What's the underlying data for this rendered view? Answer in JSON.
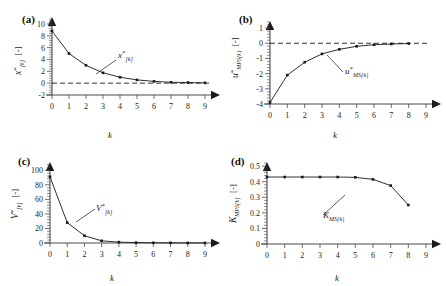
{
  "figure": {
    "panels": [
      "(a)",
      "(b)",
      "(c)",
      "(d)"
    ]
  },
  "chart_data": [
    {
      "type": "line",
      "panel_label": "(a)",
      "title": "",
      "xlabel": "k",
      "ylabel": "x*[k] [-]",
      "ylabel_parts": {
        "base": "x",
        "sup": "*",
        "sub": "[k]",
        "unit": "[-]"
      },
      "annotation": "x*[k]",
      "annotation_parts": {
        "base": "x",
        "sup": "*",
        "sub": "[k]"
      },
      "x": [
        0,
        1,
        2,
        3,
        4,
        5,
        6,
        7,
        8,
        9
      ],
      "values": [
        8.8,
        5.0,
        3.0,
        1.75,
        1.0,
        0.55,
        0.3,
        0.15,
        0.1,
        0.05
      ],
      "xlim": [
        0,
        9
      ],
      "ylim": [
        -2,
        11
      ],
      "yticks": [
        -2,
        0,
        2,
        4,
        6,
        8,
        10
      ],
      "ytick_labels": [
        "-2",
        "0",
        "2",
        "4",
        "6",
        "8",
        "10"
      ],
      "xticks": [
        0,
        1,
        2,
        3,
        4,
        5,
        6,
        7,
        8,
        9
      ],
      "xtick_labels": [
        "0",
        "1",
        "2",
        "3",
        "4",
        "5",
        "6",
        "7",
        "8",
        "9"
      ],
      "reference_line": 0,
      "grid": false,
      "legend": "none"
    },
    {
      "type": "line",
      "panel_label": "(b)",
      "title": "",
      "xlabel": "k",
      "ylabel": "u*MPS{k} [-]",
      "ylabel_parts": {
        "base": "u",
        "sup": "*",
        "sub": "MPS{k}",
        "unit": "[-]"
      },
      "annotation": "u*MS{k}",
      "annotation_parts": {
        "base": "u",
        "sup": "*",
        "sub": "MS{k}"
      },
      "x": [
        0,
        1,
        2,
        3,
        4,
        5,
        6,
        7,
        8
      ],
      "values": [
        -3.9,
        -2.1,
        -1.25,
        -0.7,
        -0.4,
        -0.2,
        -0.1,
        -0.05,
        -0.02
      ],
      "xlim": [
        0,
        9
      ],
      "ylim": [
        -4,
        1.4
      ],
      "yticks": [
        -4,
        -3,
        -2,
        -1,
        0,
        1
      ],
      "ytick_labels": [
        "-4",
        "-3",
        "-2",
        "-1",
        "0",
        "1"
      ],
      "xticks": [
        0,
        1,
        2,
        3,
        4,
        5,
        6,
        7,
        8,
        9
      ],
      "xtick_labels": [
        "0",
        "1",
        "2",
        "3",
        "4",
        "5",
        "6",
        "7",
        "8",
        "9"
      ],
      "reference_line": 0,
      "grid": false,
      "legend": "none"
    },
    {
      "type": "line",
      "panel_label": "(c)",
      "title": "",
      "xlabel": "k",
      "ylabel": "V*[k] [-]",
      "ylabel_parts": {
        "base": "V",
        "sup": "*",
        "sub": "[k]",
        "unit": "[-]"
      },
      "annotation": "V*[k]",
      "annotation_parts": {
        "base": "V",
        "sup": "*",
        "sub": "[k]"
      },
      "x": [
        0,
        1,
        2,
        3,
        4,
        5,
        6,
        7,
        8,
        9
      ],
      "values": [
        91,
        28,
        10,
        3,
        1.2,
        0.5,
        0.3,
        0.2,
        0.1,
        0.05
      ],
      "xlim": [
        0,
        9
      ],
      "ylim": [
        0,
        110
      ],
      "yticks": [
        0,
        20,
        40,
        60,
        80,
        100
      ],
      "ytick_labels": [
        "0",
        "20",
        "40",
        "60",
        "80",
        "100"
      ],
      "xticks": [
        0,
        1,
        2,
        3,
        4,
        5,
        6,
        7,
        8,
        9
      ],
      "xtick_labels": [
        "0",
        "1",
        "2",
        "3",
        "4",
        "5",
        "6",
        "7",
        "8",
        "9"
      ],
      "reference_line": null,
      "grid": false,
      "legend": "none"
    },
    {
      "type": "line",
      "panel_label": "(d)",
      "title": "",
      "xlabel": "k",
      "ylabel": "KMPS{k} [-]",
      "ylabel_parts": {
        "base": "K",
        "sup": "",
        "sub": "MPS{k}",
        "unit": "[-]"
      },
      "annotation": "KMS{k}",
      "annotation_parts": {
        "base": "K",
        "sup": "",
        "sub": "MS{k}"
      },
      "x": [
        0,
        1,
        2,
        3,
        4,
        5,
        6,
        7,
        8
      ],
      "values": [
        0.43,
        0.43,
        0.43,
        0.43,
        0.43,
        0.428,
        0.415,
        0.375,
        0.25
      ],
      "xlim": [
        0,
        9
      ],
      "ylim": [
        0,
        0.52
      ],
      "yticks": [
        0,
        0.1,
        0.2,
        0.3,
        0.4,
        0.5
      ],
      "ytick_labels": [
        "0",
        "0.1",
        "0.2",
        "0.3",
        "0.4",
        "0.5"
      ],
      "xticks": [
        0,
        1,
        2,
        3,
        4,
        5,
        6,
        7,
        8,
        9
      ],
      "xtick_labels": [
        "0",
        "1",
        "2",
        "3",
        "4",
        "5",
        "6",
        "7",
        "8",
        "9"
      ],
      "reference_line": null,
      "grid": false,
      "legend": "none"
    }
  ]
}
